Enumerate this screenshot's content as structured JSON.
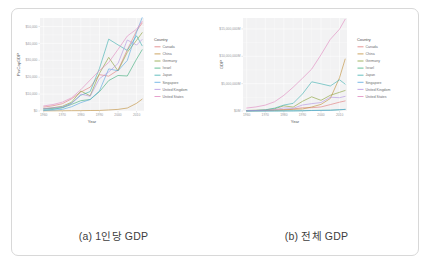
{
  "figure": {
    "subfigures": [
      {
        "caption": "(a) 1인당 GDP",
        "xlabel": "Year",
        "ylabel": "PerCapGDP",
        "legend_title": "Country"
      },
      {
        "caption": "(b) 전체 GDP",
        "xlabel": "Year",
        "ylabel": "GDP",
        "legend_title": "Country"
      }
    ]
  },
  "chart_data": [
    {
      "type": "line",
      "title": "(a) 1인당 GDP",
      "xlabel": "Year",
      "ylabel": "PerCapGDP",
      "legend_position": "right",
      "legend_title": "Country",
      "grid": true,
      "xlim": [
        1958,
        2014
      ],
      "ylim": [
        0,
        55000
      ],
      "xticks": [
        1960,
        1970,
        1980,
        1990,
        2000,
        2010
      ],
      "xtick_labels": [
        "1960",
        "1970",
        "1980",
        "1990",
        "2000",
        "2010"
      ],
      "yticks": [
        0,
        10000,
        20000,
        30000,
        40000,
        50000
      ],
      "ytick_labels": [
        "$0",
        "$10,000",
        "$20,000",
        "$30,000",
        "$40,000",
        "$50,000"
      ],
      "x": [
        1960,
        1965,
        1970,
        1975,
        1980,
        1985,
        1990,
        1995,
        2000,
        2005,
        2010,
        2013
      ],
      "series": [
        {
          "name": "Canada",
          "color": "#e07b7b",
          "values": [
            2300,
            3100,
            4300,
            7200,
            11200,
            14100,
            21500,
            20600,
            24200,
            36200,
            47400,
            52000
          ]
        },
        {
          "name": "China",
          "color": "#c08f3a",
          "values": [
            90,
            100,
            113,
            178,
            195,
            294,
            318,
            610,
            959,
            1753,
            4550,
            6990
          ]
        },
        {
          "name": "Germany",
          "color": "#8aa13a",
          "values": [
            1290,
            1940,
            2770,
            5200,
            11800,
            9000,
            22200,
            31700,
            23700,
            34700,
            41800,
            46300
          ]
        },
        {
          "name": "Israel",
          "color": "#3fae7b",
          "values": [
            1230,
            1560,
            1890,
            3900,
            6100,
            6800,
            11400,
            18000,
            21000,
            20700,
            30700,
            36200
          ]
        },
        {
          "name": "Japan",
          "color": "#3fb0b0",
          "values": [
            479,
            920,
            2030,
            4660,
            9300,
            11500,
            25100,
            42500,
            39100,
            35800,
            44500,
            38600
          ]
        },
        {
          "name": "Singapore",
          "color": "#5aa8e0",
          "values": [
            428,
            540,
            926,
            2500,
            4930,
            6800,
            11900,
            24900,
            23800,
            29900,
            46600,
            55200
          ]
        },
        {
          "name": "United Kingdom",
          "color": "#b393e0",
          "values": [
            1380,
            1870,
            2350,
            4300,
            10000,
            8700,
            19100,
            23100,
            28100,
            42000,
            39000,
            42300
          ]
        },
        {
          "name": "United States",
          "color": "#e08ac0",
          "values": [
            3000,
            3830,
            5230,
            7800,
            12600,
            18300,
            23900,
            28700,
            36400,
            44300,
            48400,
            53000
          ]
        }
      ]
    },
    {
      "type": "line",
      "title": "(b) 전체 GDP",
      "xlabel": "Year",
      "ylabel": "GDP",
      "legend_position": "right",
      "legend_title": "Country",
      "grid": true,
      "xlim": [
        1958,
        2014
      ],
      "ylim": [
        0,
        17000000
      ],
      "xticks": [
        1960,
        1970,
        1980,
        1990,
        2000,
        2010
      ],
      "xtick_labels": [
        "1960",
        "1970",
        "1980",
        "1990",
        "2000",
        "2010"
      ],
      "yticks": [
        0,
        5000000,
        10000000,
        15000000
      ],
      "ytick_labels": [
        "$0M",
        "$5,000,000M",
        "$10,000,000M",
        "$15,000,000M"
      ],
      "x": [
        1960,
        1965,
        1970,
        1975,
        1980,
        1985,
        1990,
        1995,
        2000,
        2005,
        2010,
        2013
      ],
      "series": [
        {
          "name": "Canada",
          "color": "#e07b7b",
          "values": [
            41000,
            57000,
            87000,
            173000,
            273000,
            364000,
            594000,
            604000,
            742000,
            1169000,
            1614000,
            1839000
          ]
        },
        {
          "name": "China",
          "color": "#c08f3a",
          "values": [
            59000,
            70000,
            92000,
            163000,
            191000,
            309000,
            361000,
            734000,
            1211000,
            2286000,
            6101000,
            9490000
          ]
        },
        {
          "name": "Germany",
          "color": "#8aa13a",
          "values": [
            92000,
            143000,
            216000,
            410000,
            946000,
            715000,
            1765000,
            2594000,
            1950000,
            2866000,
            3417000,
            3753000
          ]
        },
        {
          "name": "Israel",
          "color": "#3fae7b",
          "values": [
            2600,
            4100,
            5700,
            13600,
            24000,
            28000,
            53000,
            99000,
            132000,
            143000,
            233000,
            292000
          ]
        },
        {
          "name": "Japan",
          "color": "#3fb0b0",
          "values": [
            44000,
            91000,
            213000,
            521000,
            1087000,
            1399000,
            3104000,
            5334000,
            4968000,
            4572000,
            5700000,
            4919000
          ]
        },
        {
          "name": "Singapore",
          "color": "#5aa8e0",
          "values": [
            700,
            975,
            1920,
            5600,
            11700,
            17900,
            36800,
            83000,
            95800,
            125400,
            236400,
            297900
          ]
        },
        {
          "name": "United Kingdom",
          "color": "#b393e0",
          "values": [
            73000,
            102000,
            131000,
            241000,
            565000,
            489000,
            1093000,
            1344000,
            1548000,
            2521000,
            2429000,
            2678000
          ]
        },
        {
          "name": "United States",
          "color": "#e08ac0",
          "values": [
            543000,
            744000,
            1076000,
            1689000,
            2862000,
            4347000,
            5980000,
            7664000,
            10285000,
            13094000,
            14964000,
            16768000
          ]
        }
      ]
    }
  ]
}
